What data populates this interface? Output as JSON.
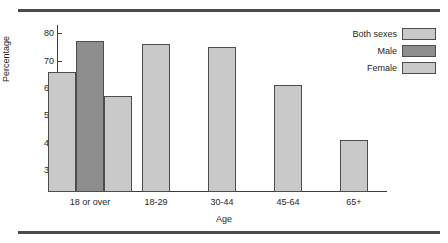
{
  "chart_data": {
    "type": "bar",
    "title": "",
    "subtitle": "",
    "xlabel": "Age",
    "ylabel": "Percentage",
    "categories": [
      "18 or over",
      "18-29",
      "30-44",
      "45-64",
      "65+"
    ],
    "series": [
      {
        "name": "Both sexes",
        "color": "#c9c9c9",
        "values": [
          66,
          76,
          75,
          61,
          41
        ]
      },
      {
        "name": "Male",
        "color": "#8e8e8e",
        "values": [
          77,
          null,
          null,
          null,
          null
        ]
      },
      {
        "name": "Female",
        "color": "#c9c9c9",
        "values": [
          57,
          null,
          null,
          null,
          null
        ]
      }
    ],
    "ylim": [
      22,
      83
    ],
    "yticks": [
      30,
      40,
      50,
      60,
      70,
      80
    ],
    "ytick_labels": [
      "30",
      "40",
      "50",
      "60",
      "70",
      "80"
    ],
    "axis_break": true,
    "axis_break_note": "zigzag break on y-axis below 30",
    "grid": false,
    "legend_position": "top-right"
  },
  "legend": {
    "items": [
      {
        "label": "Both sexes",
        "color": "#c9c9c9"
      },
      {
        "label": "Male",
        "color": "#8e8e8e"
      },
      {
        "label": "Female",
        "color": "#c9c9c9"
      }
    ]
  },
  "axes": {
    "y_title": "Percentage",
    "x_title": "Age",
    "y_ticks": [
      "80",
      "70",
      "60",
      "50",
      "40",
      "30"
    ],
    "x_ticks": [
      "18 or over",
      "18-29",
      "30-44",
      "45-64",
      "65+"
    ]
  },
  "style": {
    "rule_color": "#4a4a52",
    "axis_color": "#3b3b3b",
    "bar_border": "#4d4d4d",
    "light_gray": "#c9c9c9",
    "dark_gray": "#8e8e8e",
    "background": "#ffffff"
  }
}
